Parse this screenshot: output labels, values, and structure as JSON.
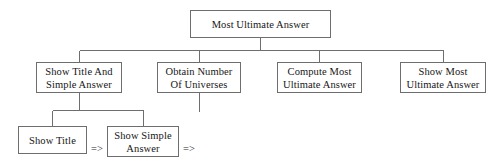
{
  "diagram": {
    "type": "tree",
    "title_text": "Most Ultimate Answer",
    "background_color": "#ffffff",
    "line_color": "#6e6e6e",
    "text_color": "#161616",
    "root": {
      "id": "most-ultimate-answer",
      "lines": [
        "Most Ultimate Answer"
      ],
      "x": 190,
      "y": 10,
      "w": 141,
      "h": 28
    },
    "level2": [
      {
        "id": "show-title-and-simple-answer",
        "lines": [
          "Show Title And",
          "Simple Answer"
        ],
        "x": 36,
        "y": 62,
        "w": 86,
        "h": 31
      },
      {
        "id": "obtain-number-of-universes",
        "lines": [
          "Obtain Number",
          "Of Universes"
        ],
        "x": 157,
        "y": 62,
        "w": 84,
        "h": 31
      },
      {
        "id": "compute-most-ultimate-answer",
        "lines": [
          "Compute Most",
          "Ultimate Answer"
        ],
        "x": 277,
        "y": 62,
        "w": 85,
        "h": 31
      },
      {
        "id": "show-most-ultimate-answer",
        "lines": [
          "Show Most",
          "Ultimate Answer"
        ],
        "x": 400,
        "y": 62,
        "w": 86,
        "h": 31
      }
    ],
    "level3": [
      {
        "id": "show-title",
        "lines": [
          "Show Title"
        ],
        "x": 18,
        "y": 126,
        "w": 69,
        "h": 28
      },
      {
        "id": "show-simple-answer",
        "lines": [
          "Show Simple",
          "Answer"
        ],
        "x": 107,
        "y": 126,
        "w": 72,
        "h": 31
      }
    ],
    "arrows": [
      {
        "id": "arrow-after-show-title",
        "glyph": "=>",
        "x": 91,
        "y": 143
      },
      {
        "id": "arrow-after-show-simple-answer",
        "glyph": "=>",
        "x": 183,
        "y": 143
      }
    ],
    "edges": {
      "root_stem": {
        "x": 260,
        "y1": 38,
        "y2": 50
      },
      "bus_main": {
        "x1": 79,
        "x2": 443,
        "y": 50
      },
      "drops_main": [
        {
          "x": 79,
          "y1": 50,
          "y2": 62
        },
        {
          "x": 199,
          "y1": 50,
          "y2": 62
        },
        {
          "x": 319,
          "y1": 50,
          "y2": 62
        },
        {
          "x": 443,
          "y1": 50,
          "y2": 62
        }
      ],
      "sub_stem": {
        "x": 79,
        "y1": 93,
        "y2": 110
      },
      "bus_sub": {
        "x1": 52,
        "x2": 143,
        "y": 110
      },
      "drops_sub": [
        {
          "x": 52,
          "y1": 110,
          "y2": 126
        },
        {
          "x": 143,
          "y1": 110,
          "y2": 126
        }
      ],
      "dangling_stub": {
        "x": 199,
        "y1": 93,
        "y2": 112
      }
    }
  }
}
